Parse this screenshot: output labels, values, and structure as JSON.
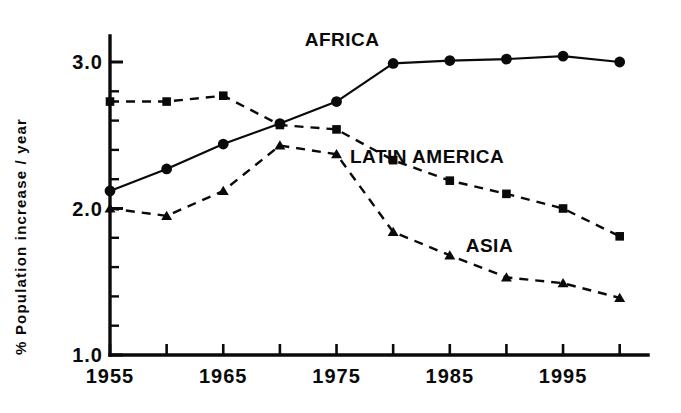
{
  "chart_data": {
    "type": "line",
    "title": "",
    "subtitle": "",
    "xlabel": "",
    "ylabel": "% Population increase / year",
    "x": [
      1955,
      1960,
      1965,
      1970,
      1975,
      1980,
      1985,
      1990,
      1995,
      2000
    ],
    "xlim": [
      1955,
      2000
    ],
    "ylim": [
      1.0,
      3.1
    ],
    "grid": false,
    "legend_position": "inline-annotations",
    "x_tick_labels": [
      "1955",
      "1965",
      "1975",
      "1985",
      "1995"
    ],
    "x_tick_values": [
      1955,
      1965,
      1975,
      1985,
      1995
    ],
    "x_minor_tick_values": [
      1960,
      1970,
      1980,
      1990,
      2000
    ],
    "y_tick_labels": [
      "1.0",
      "2.0",
      "3.0"
    ],
    "y_tick_values": [
      1.0,
      2.0,
      3.0
    ],
    "y_minor_tick_values": [
      1.1,
      1.2,
      1.3,
      1.4,
      1.5,
      1.6,
      1.7,
      1.8,
      1.9,
      2.1,
      2.2,
      2.3,
      2.4,
      2.5,
      2.6,
      2.7,
      2.8,
      2.9,
      3.0
    ],
    "series": [
      {
        "name": "AFRICA",
        "marker": "circle",
        "linestyle": "solid",
        "color": "#0a0a0a",
        "values": [
          2.12,
          2.27,
          2.44,
          2.58,
          2.73,
          2.99,
          3.01,
          3.02,
          3.04,
          3.0
        ],
        "label_x": 1975.5,
        "label_y": 3.11
      },
      {
        "name": "LATIN AMERICA",
        "marker": "square",
        "linestyle": "dashed",
        "color": "#0a0a0a",
        "values": [
          2.73,
          2.73,
          2.77,
          2.57,
          2.54,
          2.33,
          2.19,
          2.1,
          2.0,
          1.81
        ],
        "label_x": 1983.0,
        "label_y": 2.31
      },
      {
        "name": "ASIA",
        "marker": "triangle",
        "linestyle": "dashed",
        "color": "#0a0a0a",
        "values": [
          2.0,
          1.95,
          2.12,
          2.43,
          2.37,
          1.84,
          1.68,
          1.53,
          1.49,
          1.39
        ],
        "label_x": 1988.5,
        "label_y": 1.7
      }
    ]
  },
  "axes": {
    "y_axis_title": "% Population increase / year",
    "y_tick_3": "3.0",
    "y_tick_2": "2.0",
    "y_tick_1": "1.0",
    "x_tick_1955": "1955",
    "x_tick_1965": "1965",
    "x_tick_1975": "1975",
    "x_tick_1985": "1985",
    "x_tick_1995": "1995"
  },
  "annotations": {
    "africa": "AFRICA",
    "latin_america": "LATIN AMERICA",
    "asia": "ASIA"
  },
  "colors": {
    "ink": "#0a0a0a",
    "background": "#ffffff"
  }
}
